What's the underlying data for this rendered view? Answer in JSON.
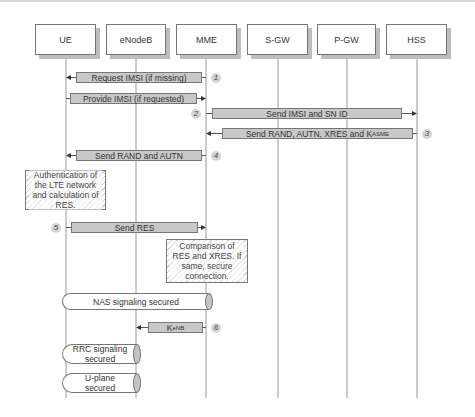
{
  "diagram": {
    "type": "sequence",
    "title": "",
    "entities": [
      {
        "id": "ue",
        "label": "UE",
        "x": 35,
        "w": 61,
        "lifeline_x": 66
      },
      {
        "id": "enodeb",
        "label": "eNodeB",
        "x": 106,
        "w": 60,
        "lifeline_x": 136
      },
      {
        "id": "mme",
        "label": "MME",
        "x": 176,
        "w": 61,
        "lifeline_x": 206
      },
      {
        "id": "sgw",
        "label": "S-GW",
        "x": 247,
        "w": 61,
        "lifeline_x": 278
      },
      {
        "id": "pgw",
        "label": "P-GW",
        "x": 317,
        "w": 59,
        "lifeline_x": 347
      },
      {
        "id": "hss",
        "label": "HSS",
        "x": 386,
        "w": 61,
        "lifeline_x": 417
      }
    ],
    "entity_box_y": 24,
    "entity_box_h": 31,
    "lifeline_end_y": 398,
    "messages": [
      {
        "step": "1",
        "label": "Request IMSI (if missing)",
        "from": "mme",
        "to": "ue",
        "x": 76,
        "w": 126,
        "y": 72,
        "step_side": "right"
      },
      {
        "step": "",
        "label": "Provide IMSI (if requested)",
        "from": "ue",
        "to": "mme",
        "x": 70,
        "w": 127,
        "y": 93,
        "step_side": "none"
      },
      {
        "step": "2",
        "label": "Send IMSI and SN ID",
        "from": "mme",
        "to": "hss",
        "x": 212,
        "w": 190,
        "y": 108,
        "step_side": "left"
      },
      {
        "step": "3",
        "label": "Send RAND, AUTN, XRES and K",
        "label_sub": "ASME",
        "from": "hss",
        "to": "mme",
        "x": 222,
        "w": 191,
        "y": 128,
        "step_side": "right"
      },
      {
        "step": "4",
        "label": "Send RAND and AUTN",
        "from": "mme",
        "to": "ue",
        "x": 76,
        "w": 126,
        "y": 150,
        "step_side": "right"
      },
      {
        "step": "5",
        "label": "Send RES",
        "from": "ue",
        "to": "mme",
        "x": 71,
        "w": 127,
        "y": 222,
        "step_side": "left"
      },
      {
        "step": "6",
        "label": "K",
        "label_sub": "eNB",
        "from": "mme",
        "to": "enodeb",
        "x": 148,
        "w": 55,
        "y": 322,
        "step_side": "right"
      }
    ],
    "notes": [
      {
        "text": "Authentication of the LTE network and calculation of RES.",
        "x": 25,
        "y": 170,
        "w": 81,
        "h": 40
      },
      {
        "text": "Comparison of RES and XRES. If same, secure connection.",
        "x": 166,
        "y": 239,
        "w": 82,
        "h": 44
      }
    ],
    "secured_channels": [
      {
        "label": "NAS signaling secured",
        "x": 62,
        "y": 293,
        "w": 151,
        "h": 17
      },
      {
        "label": "RRC signaling secured",
        "x": 62,
        "y": 344,
        "w": 79,
        "h": 20
      },
      {
        "label": "U-plane secured",
        "x": 62,
        "y": 373,
        "w": 79,
        "h": 20
      }
    ],
    "colors": {
      "bar_fill": "#c8c8c8",
      "line": "#777777",
      "shadow": "#bdbdbd",
      "cylinder_cap": "#c4c4c4"
    }
  }
}
